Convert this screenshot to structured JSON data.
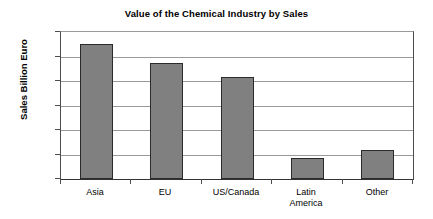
{
  "chart_data": {
    "type": "bar",
    "title": "Value of the Chemical Industry by Sales",
    "xlabel": "",
    "ylabel": "Sales Billion Euro",
    "categories": [
      "Asia",
      "EU",
      "US/Canada",
      "Latin America",
      "Other"
    ],
    "category_lines": [
      [
        "Asia"
      ],
      [
        "EU"
      ],
      [
        "US/Canada"
      ],
      [
        "Latin",
        "America"
      ],
      [
        "Other"
      ]
    ],
    "values": [
      550,
      475,
      415,
      85,
      120
    ],
    "ylim": [
      0,
      600
    ],
    "ytick_step": 100,
    "yticks": [
      600,
      500,
      400,
      300,
      200,
      100,
      0
    ],
    "ytick_labels": [
      "600",
      "500",
      "400",
      "300",
      "200",
      "100",
      "0"
    ],
    "grid": "horizontal",
    "legend": "none",
    "bar_color": "#808080",
    "bar_border_color": "#2b2b2b",
    "gridline_color": "#9a9a9a",
    "axis_color": "#333333",
    "background": "#ffffff"
  }
}
